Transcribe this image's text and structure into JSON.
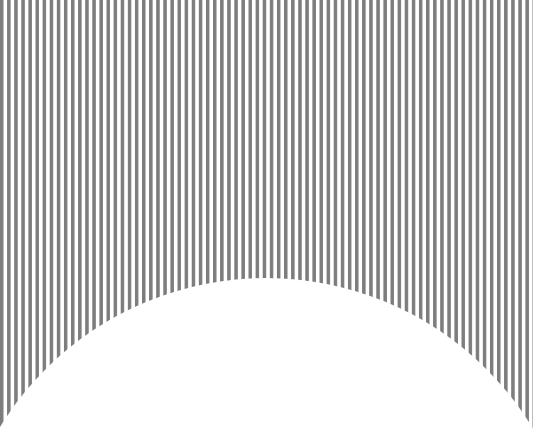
{
  "canvas": {
    "width": 533,
    "height": 430,
    "background_color": "#ffffff",
    "description": "Vertical gray striped field occupying the upper region, clipped from below by a large white circular arc rising from the bottom edge"
  },
  "figure": {
    "name": "striped-arc-figure",
    "label": "",
    "stripes": {
      "orientation": "vertical",
      "stripe_color": "#7d7d7d",
      "gap_color": "#ffffff",
      "period_px": 7.1,
      "stripe_width_px": 3.5,
      "gap_width_px": 3.6,
      "duty_cycle_percent": 49,
      "start_x_px": 0,
      "start_y_px": 0,
      "first_band": "stripe",
      "stripe_count": 75,
      "field_top_px": 0,
      "field_left_px": 0,
      "field_right_px": 533,
      "field_bottom_px": 383
    },
    "arc": {
      "shape": "circle",
      "fill_color": "#ffffff",
      "center_x_px": 266,
      "center_y_px": 590,
      "radius_px": 312,
      "apex_x_px": 266,
      "apex_y_px": 278,
      "left_edge_intersect_y_px": 382,
      "right_edge_intersect_y_px": 382,
      "opens_from": "bottom"
    }
  },
  "colors": {
    "stripe_gray": "#7d7d7d",
    "white": "#ffffff"
  }
}
